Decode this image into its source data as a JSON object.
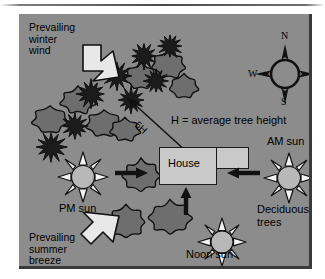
{
  "figure": {
    "panel_color": "#8c8c8c",
    "border_color": "#3a3a3a"
  },
  "labels": {
    "winter_wind": "Prevailing\nwinter\nwind",
    "summer_breeze": "Prevailing\nsummer\nbreeze",
    "pm_sun": "PM sun",
    "am_sun": "AM sun",
    "noon_sun": "Noon sun",
    "deciduous_trees": "Deciduous\ntrees",
    "house": "House",
    "legend": "H = average tree height",
    "distance": "5H"
  },
  "compass": {
    "north": "N",
    "south": "S",
    "east": "E",
    "west": "W"
  },
  "icons": {
    "winter_wind_arrow": "block-arrow-southeast-icon",
    "summer_breeze_arrow": "block-arrow-northeast-icon",
    "pm_sun": "sun-icon",
    "am_sun": "sun-icon",
    "noon_sun": "sun-icon",
    "compass_rose": "compass-rose-icon",
    "pm_ray_arrow": "arrow-right-icon",
    "am_ray_arrow": "arrow-left-icon",
    "noon_ray_arrow": "arrow-up-icon",
    "distance_arrow": "double-headed-arrow-icon",
    "evergreen_tree": "evergreen-tree-icon",
    "deciduous_tree": "deciduous-tree-icon",
    "house": "house-icon"
  },
  "evergreen_trees": [
    {
      "x": 14,
      "y": 115,
      "r": 15
    },
    {
      "x": 40,
      "y": 96,
      "r": 13
    },
    {
      "x": 55,
      "y": 63,
      "r": 14
    },
    {
      "x": 81,
      "y": 45,
      "r": 14
    },
    {
      "x": 96,
      "y": 70,
      "r": 13
    },
    {
      "x": 109,
      "y": 26,
      "r": 13
    },
    {
      "x": 122,
      "y": 52,
      "r": 12
    },
    {
      "x": 136,
      "y": 17,
      "r": 12
    }
  ],
  "upper_deciduous_trees": [
    {
      "x": 8,
      "y": 88,
      "rx": 19,
      "ry": 14
    },
    {
      "x": 36,
      "y": 69,
      "rx": 19,
      "ry": 14
    },
    {
      "x": 62,
      "y": 92,
      "rx": 19,
      "ry": 14
    },
    {
      "x": 86,
      "y": 100,
      "rx": 16,
      "ry": 12
    },
    {
      "x": 101,
      "y": 46,
      "rx": 17,
      "ry": 13
    },
    {
      "x": 128,
      "y": 33,
      "rx": 18,
      "ry": 14
    },
    {
      "x": 146,
      "y": 57,
      "rx": 15,
      "ry": 12
    }
  ],
  "lower_deciduous_trees": [
    {
      "x": 98,
      "y": 142,
      "rx": 20,
      "ry": 16
    },
    {
      "x": 83,
      "y": 188,
      "rx": 20,
      "ry": 16
    },
    {
      "x": 125,
      "y": 183,
      "rx": 22,
      "ry": 17
    }
  ]
}
